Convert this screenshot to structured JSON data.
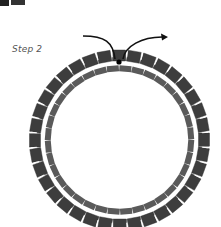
{
  "step_label": "Step 2",
  "ring": {
    "cx": 119.5,
    "cy": 140,
    "bead_count": 36,
    "outer_radius": 84,
    "inner_radius": 73,
    "bead_color_outer": "#3d3d3d",
    "bead_color_inner": "#5a5a5a",
    "gap_color": "#ffffff"
  },
  "thread": {
    "color": "#111111",
    "entry_point": [
      83,
      36
    ],
    "dot": [
      119,
      62
    ],
    "exit_point": [
      168,
      37
    ],
    "dot_color": "#000000"
  },
  "corner_fragment_color": "#222222"
}
